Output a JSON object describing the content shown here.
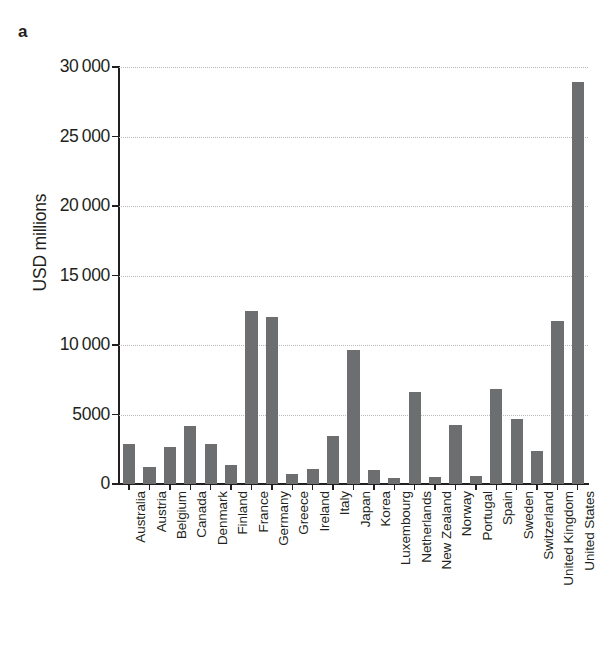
{
  "figure": {
    "panel_label": "a",
    "y_axis_title": "USD millions",
    "bar_color": "#6d6e70",
    "grid_color": "#b9b9b9",
    "axis_color": "#231f20"
  },
  "chart_data": {
    "type": "bar",
    "title": "",
    "subtitle": "",
    "xlabel": "",
    "ylabel": "USD millions",
    "ylim": [
      0,
      30000
    ],
    "ytick_values": [
      0,
      5000,
      10000,
      15000,
      20000,
      25000,
      30000
    ],
    "ytick_labels": [
      "0",
      "5000",
      "10 000",
      "15 000",
      "20 000",
      "25 000",
      "30 000"
    ],
    "grid": "horizontal-dotted",
    "legend": "none",
    "categories": [
      "Australia",
      "Austria",
      "Belgium",
      "Canada",
      "Denmark",
      "Finland",
      "France",
      "Germany",
      "Greece",
      "Ireland",
      "Italy",
      "Japan",
      "Korea",
      "Luxembourg",
      "Netherlands",
      "New Zealand",
      "Norway",
      "Portugal",
      "Spain",
      "Sweden",
      "Switzerland",
      "United Kingdom",
      "United States"
    ],
    "values": [
      2850,
      1200,
      2650,
      4200,
      2900,
      1350,
      12450,
      12050,
      750,
      1050,
      3450,
      9650,
      1000,
      450,
      6600,
      500,
      4250,
      600,
      6800,
      4700,
      2400,
      11700,
      28900
    ]
  }
}
